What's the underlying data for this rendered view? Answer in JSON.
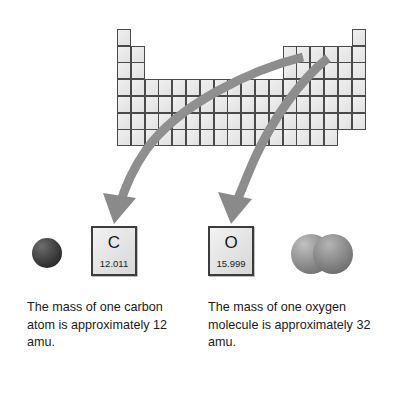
{
  "figure": {
    "background_color": "#ffffff"
  },
  "periodic_table": {
    "name": "periodic-table-outline",
    "columns": 18,
    "rows": 7,
    "cell_fill_color": "#e9e9e9",
    "cell_border_color": "#4a4a4a",
    "row_layout": [
      [
        1,
        18
      ],
      [
        1,
        2,
        13,
        14,
        15,
        16,
        17,
        18
      ],
      [
        1,
        2,
        13,
        14,
        15,
        16,
        17,
        18
      ],
      [
        1,
        2,
        3,
        4,
        5,
        6,
        7,
        8,
        9,
        10,
        11,
        12,
        13,
        14,
        15,
        16,
        17,
        18
      ],
      [
        1,
        2,
        3,
        4,
        5,
        6,
        7,
        8,
        9,
        10,
        11,
        12,
        13,
        14,
        15,
        16,
        17,
        18
      ],
      [
        1,
        2,
        3,
        4,
        5,
        6,
        7,
        8,
        9,
        10,
        11,
        12,
        13,
        14,
        15,
        16,
        17,
        18
      ],
      [
        1,
        2,
        3,
        4,
        5,
        6,
        7,
        8,
        9,
        10,
        11,
        12,
        13,
        14,
        15,
        16
      ]
    ]
  },
  "arrows": {
    "color": "#8a8a8a",
    "items": [
      {
        "name": "arrow-to-carbon",
        "from": "periodic-table",
        "to": "carbon-element-box"
      },
      {
        "name": "arrow-to-oxygen",
        "from": "periodic-table",
        "to": "oxygen-element-box"
      }
    ]
  },
  "elements": [
    {
      "name": "carbon",
      "symbol": "C",
      "atomic_mass": "12.011"
    },
    {
      "name": "oxygen",
      "symbol": "O",
      "atomic_mass": "15.999"
    }
  ],
  "models": {
    "carbon_atom": {
      "name": "carbon-atom-sphere",
      "color": "#3a3a3a",
      "sphere_count": 1
    },
    "oxygen_molecule": {
      "name": "oxygen-molecule-spheres",
      "color": "#8c8c8c",
      "sphere_count": 2
    }
  },
  "captions": {
    "carbon": "The mass of one carbon atom is approximately 12 amu.",
    "oxygen": "The mass of one oxygen molecule is approximately 32 amu."
  }
}
